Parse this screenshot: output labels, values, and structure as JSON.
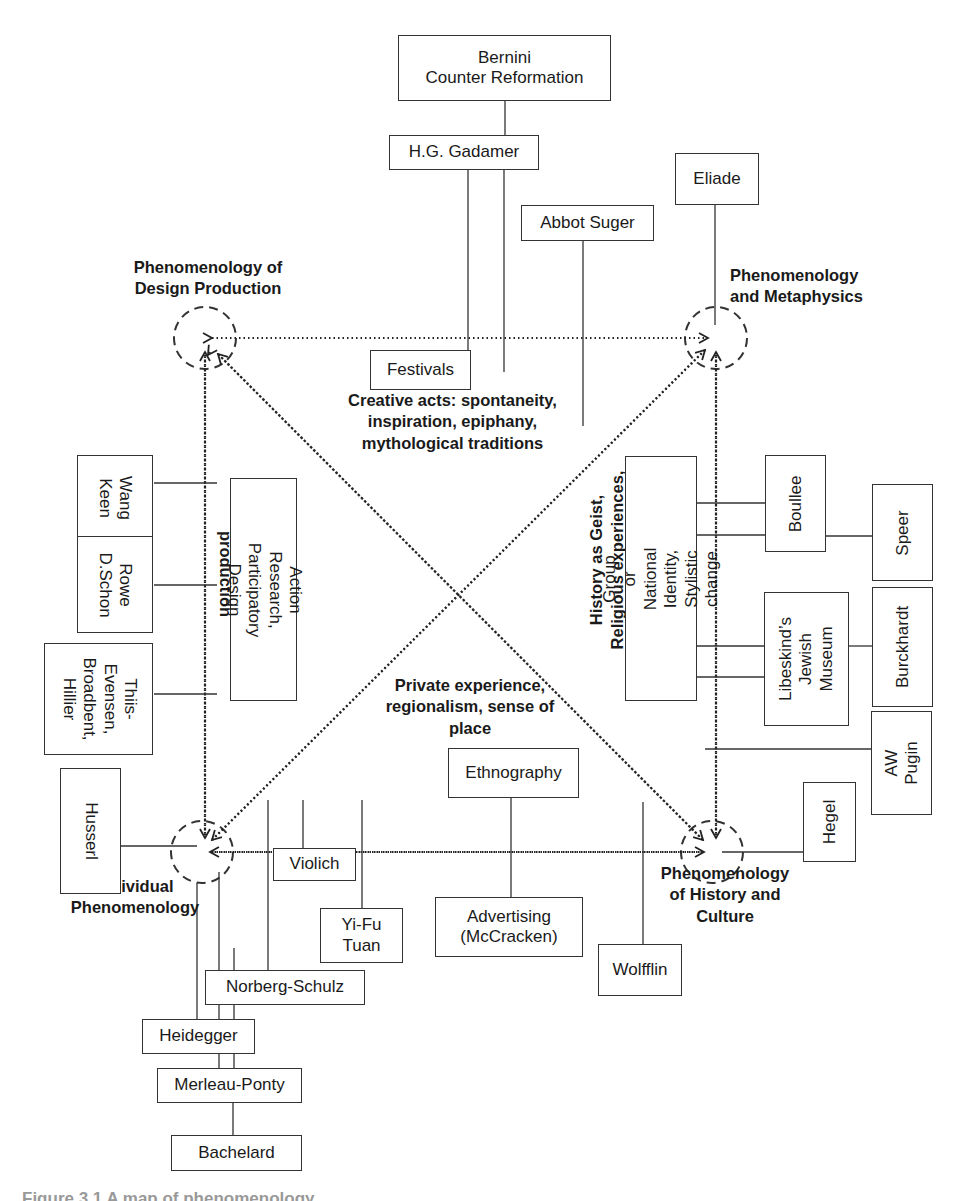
{
  "nodes": {
    "design_production": "Phenomenology of\nDesign Production",
    "metaphysics": "Phenomenology\nand Metaphysics",
    "individual": "Individual\nPhenomenology",
    "history_culture": "Phenomenology\nof History and\nCulture"
  },
  "edge_labels": {
    "top": "Creative acts: spontaneity,\ninspiration, epiphany,\nmythological traditions",
    "left": "Processes of\nproduction",
    "right": "History as Geist,\nReligious experiences,",
    "bottom": "Private experience,\nregionalism, sense of\nplace"
  },
  "boxes": {
    "bernini": "Bernini\nCounter Reformation",
    "gadamer": "H.G. Gadamer",
    "abbot_suger": "Abbot Suger",
    "eliade": "Eliade",
    "festivals": "Festivals",
    "wang_keen": "Wang\nKeen",
    "rowe_schon": "Rowe\nD.Schon",
    "thiis_evensen": "Thiis-\nEvensen,\nBroadbent,\nHillier",
    "action_research": "Action Research,\nParticipatory Design",
    "group_identity": "Group or National\nIdentity, Stylistic change",
    "boullee": "Boullee",
    "speer": "Speer",
    "libeskind": "Libeskind’s\nJewish\nMuseum",
    "burckhardt": "Burckhardt",
    "aw_pugin": "AW Pugin",
    "husserl": "Husserl",
    "hegel": "Hegel",
    "ethnography": "Ethnography",
    "violich": "Violich",
    "yi_fu_tuan": "Yi-Fu\nTuan",
    "advertising": "Advertising\n(McCracken)",
    "wolfflin": "Wolfflin",
    "norberg_schulz": "Norberg-Schulz",
    "heidegger": "Heidegger",
    "merleau_ponty": "Merleau-Ponty",
    "bachelard": "Bachelard"
  },
  "caption": "Figure 3.1 A map of phenomenology"
}
